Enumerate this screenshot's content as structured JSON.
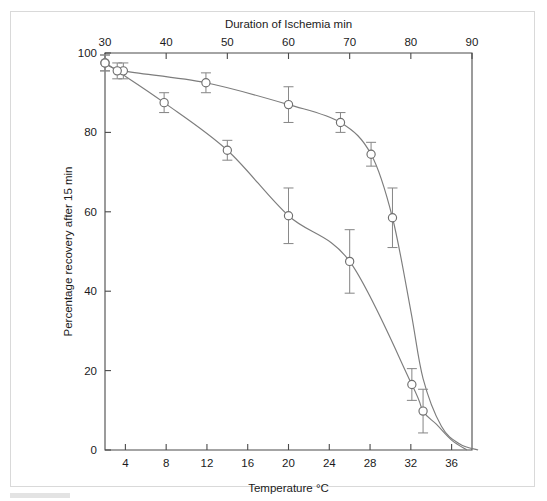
{
  "figure": {
    "title": "",
    "background_color": "#ffffff",
    "border_color": "#d9d9d9"
  },
  "chart_data": {
    "type": "line",
    "title": "",
    "subtitle": "",
    "xlabel": "Temperature °C",
    "ylabel": "Percentage recovery after 15 min",
    "top_axis_label": "Duration of Ischemia min",
    "xlim": [
      2,
      38
    ],
    "ylim": [
      0,
      100
    ],
    "top_xlim": [
      30,
      90
    ],
    "grid": false,
    "legend": null,
    "legend_position": "none",
    "xticks": [
      4,
      8,
      12,
      16,
      20,
      24,
      28,
      32,
      36
    ],
    "xticklabels": [
      "4",
      "8",
      "12",
      "16",
      "20",
      "24",
      "28",
      "32",
      "36"
    ],
    "yticks": [
      0,
      20,
      40,
      60,
      80,
      100
    ],
    "yticklabels": [
      "0",
      "20",
      "40",
      "60",
      "80",
      "100"
    ],
    "top_xticks": [
      30,
      40,
      50,
      60,
      70,
      80,
      90
    ],
    "top_xticklabels": [
      "30",
      "40",
      "50",
      "60",
      "70",
      "80",
      "90"
    ],
    "marker_style": "open-circle",
    "error_bars": "symmetric-sem",
    "series": [
      {
        "name": "Duration of Ischemia (top axis)",
        "axis": "top",
        "color": "#7d7d7d",
        "x": [
          30,
          33,
          46.5,
          60,
          68.5,
          73.5,
          77
        ],
        "y": [
          97.5,
          95.5,
          92.5,
          87,
          82.5,
          74.5,
          58.5
        ],
        "yerr": [
          2,
          2,
          2.5,
          4.5,
          2.5,
          3,
          7.5
        ]
      },
      {
        "name": "Temperature (bottom axis)",
        "axis": "bottom",
        "color": "#7d7d7d",
        "x": [
          2,
          3.2,
          7.8,
          14,
          20,
          26,
          32.1,
          33.2
        ],
        "y": [
          97.5,
          95.5,
          87.5,
          75.5,
          59,
          47.5,
          16.5,
          9.8
        ],
        "yerr": [
          2,
          2,
          2.5,
          2.5,
          7,
          8,
          4,
          5.5
        ]
      }
    ],
    "curve_paths": {
      "top_axis_curve_note": "smooth sigmoid-like decline from ~97.5% at 30 min to 0% at ~91 min, steep drop after 77 min",
      "bottom_axis_curve_note": "smooth decline from ~98% at 2 °C to 0% at ~37.5 °C"
    }
  }
}
